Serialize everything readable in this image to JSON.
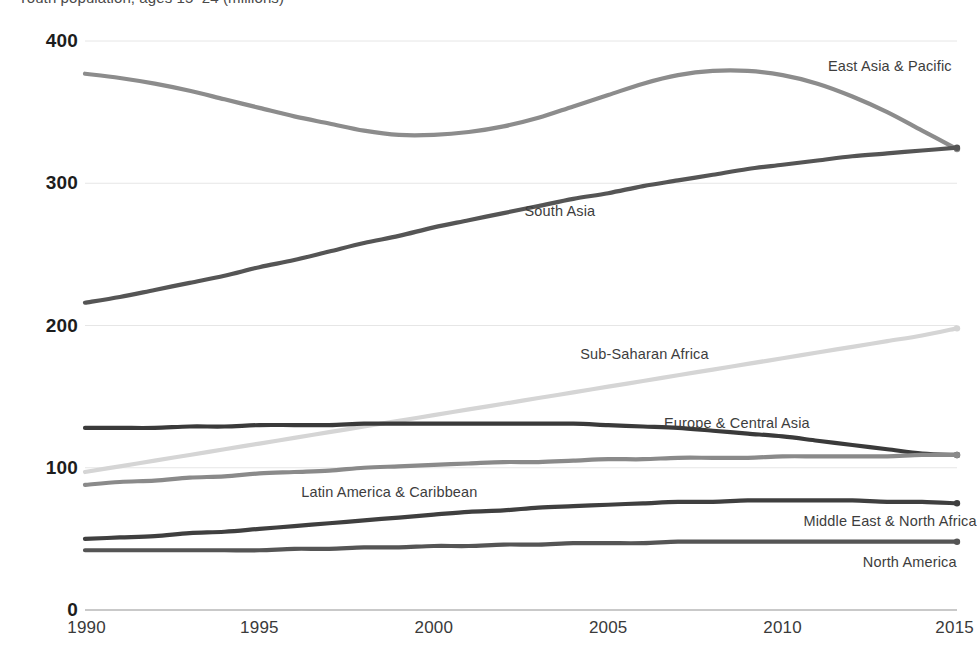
{
  "chart_data": {
    "type": "line",
    "title": "Youth population, ages 15–24 (millions)",
    "xlabel": "",
    "ylabel": "",
    "xlim": [
      1990,
      2015
    ],
    "ylim": [
      0,
      400
    ],
    "yticks": [
      "0",
      "100",
      "200",
      "300",
      "400"
    ],
    "ytick_values": [
      0,
      100,
      200,
      300,
      400
    ],
    "xticks": [
      "1990",
      "1995",
      "2000",
      "2005",
      "2010",
      "2015"
    ],
    "xtick_values": [
      1990,
      1995,
      2000,
      2005,
      2010,
      2015
    ],
    "grid": "horizontal",
    "legend": "inline-labels",
    "x": [
      1990,
      1991,
      1992,
      1993,
      1994,
      1995,
      1996,
      1997,
      1998,
      1999,
      2000,
      2001,
      2002,
      2003,
      2004,
      2005,
      2006,
      2007,
      2008,
      2009,
      2010,
      2011,
      2012,
      2013,
      2014,
      2015
    ],
    "series": [
      {
        "name": "East Asia & Pacific",
        "color": "#8c8c8c",
        "label_x": 2011.3,
        "label_y": 382,
        "values": [
          377,
          374,
          370,
          365,
          359,
          353,
          347,
          342,
          337,
          334,
          334,
          336,
          340,
          346,
          354,
          362,
          370,
          376,
          379,
          379,
          376,
          370,
          361,
          350,
          337,
          324
        ]
      },
      {
        "name": "South Asia",
        "color": "#555555",
        "label_x": 2002.6,
        "label_y": 280,
        "values": [
          216,
          220,
          225,
          230,
          235,
          241,
          246,
          252,
          258,
          263,
          269,
          274,
          279,
          284,
          289,
          293,
          298,
          302,
          306,
          310,
          313,
          316,
          319,
          321,
          323,
          325
        ]
      },
      {
        "name": "Sub-Saharan Africa",
        "color": "#d5d5d5",
        "label_x": 2004.2,
        "label_y": 179,
        "values": [
          97,
          101,
          105,
          109,
          113,
          117,
          121,
          125,
          129,
          133,
          137,
          141,
          145,
          149,
          153,
          157,
          161,
          165,
          169,
          173,
          177,
          181,
          185,
          189,
          193,
          198
        ]
      },
      {
        "name": "Europe & Central Asia",
        "color": "#3a3a3a",
        "label_x": 2006.6,
        "label_y": 131,
        "values": [
          128,
          128,
          128,
          129,
          129,
          130,
          130,
          130,
          131,
          131,
          131,
          131,
          131,
          131,
          131,
          130,
          129,
          128,
          126,
          124,
          122,
          119,
          116,
          113,
          110,
          109
        ]
      },
      {
        "name": "Latin America & Caribbean",
        "color": "#8a8a8a",
        "label_x": 1996.2,
        "label_y": 82,
        "values": [
          88,
          90,
          91,
          93,
          94,
          96,
          97,
          98,
          100,
          101,
          102,
          103,
          104,
          104,
          105,
          106,
          106,
          107,
          107,
          107,
          108,
          108,
          108,
          108,
          109,
          109
        ]
      },
      {
        "name": "Middle East & North Africa",
        "color": "#3f3f3f",
        "label_x": 2010.6,
        "label_y": 62,
        "values": [
          50,
          51,
          52,
          54,
          55,
          57,
          59,
          61,
          63,
          65,
          67,
          69,
          70,
          72,
          73,
          74,
          75,
          76,
          76,
          77,
          77,
          77,
          77,
          76,
          76,
          75
        ]
      },
      {
        "name": "North America",
        "color": "#555555",
        "label_x": 2012.3,
        "label_y": 33,
        "values": [
          42,
          42,
          42,
          42,
          42,
          42,
          43,
          43,
          44,
          44,
          45,
          45,
          46,
          46,
          47,
          47,
          47,
          48,
          48,
          48,
          48,
          48,
          48,
          48,
          48,
          48
        ]
      }
    ]
  }
}
